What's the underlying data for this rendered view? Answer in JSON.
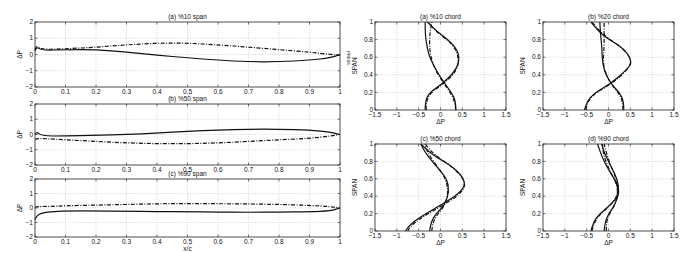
{
  "figure": {
    "side_label": "PRESS"
  },
  "chart_data": [
    {
      "id": "a_span",
      "type": "line",
      "title": "(a) %10 span",
      "xlabel": "",
      "ylabel": "ΔP",
      "xlim": [
        0,
        1
      ],
      "ylim": [
        -2,
        2
      ],
      "xticks": [
        0,
        0.1,
        0.2,
        0.3,
        0.4,
        0.5,
        0.6,
        0.7,
        0.8,
        0.9,
        1
      ],
      "yticks": [
        -2,
        -1,
        0,
        1,
        2
      ],
      "grid": true,
      "series": [
        {
          "name": "solid",
          "style": "solid",
          "x": [
            0,
            0.005,
            0.02,
            0.1,
            0.2,
            0.3,
            0.4,
            0.5,
            0.6,
            0.7,
            0.8,
            0.9,
            0.97,
            1
          ],
          "y": [
            0.2,
            0.5,
            0.25,
            0.3,
            0.3,
            0.15,
            -0.05,
            -0.2,
            -0.35,
            -0.45,
            -0.45,
            -0.35,
            -0.2,
            0
          ]
        },
        {
          "name": "dash-dot",
          "style": "dashed",
          "x": [
            0,
            0.005,
            0.02,
            0.1,
            0.2,
            0.3,
            0.4,
            0.5,
            0.6,
            0.7,
            0.8,
            0.9,
            0.97,
            1
          ],
          "y": [
            0.3,
            0.6,
            0.3,
            0.35,
            0.45,
            0.6,
            0.7,
            0.7,
            0.6,
            0.45,
            0.3,
            0.15,
            0.0,
            -0.05
          ]
        }
      ]
    },
    {
      "id": "b_span",
      "type": "line",
      "title": "(b) %50 span",
      "xlabel": "",
      "ylabel": "ΔP",
      "xlim": [
        0,
        1
      ],
      "ylim": [
        -2,
        2
      ],
      "xticks": [
        0,
        0.1,
        0.2,
        0.3,
        0.4,
        0.5,
        0.6,
        0.7,
        0.8,
        0.9,
        1
      ],
      "yticks": [
        -2,
        -1,
        0,
        1,
        2
      ],
      "grid": true,
      "series": [
        {
          "name": "solid",
          "style": "solid",
          "x": [
            0,
            0.005,
            0.02,
            0.1,
            0.2,
            0.3,
            0.4,
            0.5,
            0.6,
            0.7,
            0.8,
            0.9,
            0.97,
            1
          ],
          "y": [
            0.0,
            0.2,
            -0.1,
            -0.1,
            -0.05,
            0.0,
            0.1,
            0.2,
            0.3,
            0.35,
            0.35,
            0.3,
            0.15,
            0
          ]
        },
        {
          "name": "dash-dot",
          "style": "dashed",
          "x": [
            0,
            0.005,
            0.02,
            0.1,
            0.2,
            0.3,
            0.4,
            0.5,
            0.6,
            0.7,
            0.8,
            0.9,
            0.97,
            1
          ],
          "y": [
            -0.3,
            -0.3,
            -0.25,
            -0.35,
            -0.45,
            -0.55,
            -0.6,
            -0.6,
            -0.55,
            -0.45,
            -0.35,
            -0.25,
            -0.1,
            0
          ]
        }
      ]
    },
    {
      "id": "c_span",
      "type": "line",
      "title": "(c) %90 span",
      "xlabel": "x/c",
      "ylabel": "ΔP",
      "xlim": [
        0,
        1
      ],
      "ylim": [
        -2,
        2
      ],
      "xticks": [
        0,
        0.1,
        0.2,
        0.3,
        0.4,
        0.5,
        0.6,
        0.7,
        0.8,
        0.9,
        1
      ],
      "yticks": [
        -2,
        -1,
        0,
        1,
        2
      ],
      "grid": true,
      "series": [
        {
          "name": "solid",
          "style": "solid",
          "x": [
            0,
            0.005,
            0.02,
            0.05,
            0.1,
            0.2,
            0.3,
            0.4,
            0.5,
            0.6,
            0.7,
            0.8,
            0.9,
            0.97,
            1
          ],
          "y": [
            -0.8,
            -0.55,
            -0.35,
            -0.25,
            -0.2,
            -0.2,
            -0.22,
            -0.25,
            -0.25,
            -0.28,
            -0.3,
            -0.28,
            -0.25,
            -0.2,
            0
          ]
        },
        {
          "name": "dash-dot",
          "style": "dashed",
          "x": [
            0,
            0.005,
            0.02,
            0.05,
            0.1,
            0.2,
            0.3,
            0.4,
            0.5,
            0.6,
            0.7,
            0.8,
            0.9,
            0.97,
            1
          ],
          "y": [
            0.05,
            0.1,
            0.1,
            0.12,
            0.15,
            0.2,
            0.25,
            0.3,
            0.3,
            0.3,
            0.28,
            0.25,
            0.18,
            0.1,
            0
          ]
        }
      ]
    },
    {
      "id": "a_chord",
      "type": "line",
      "title": "(a) %10 chord",
      "xlabel": "ΔP",
      "ylabel": "SPAN",
      "xlim": [
        -1.5,
        1.5
      ],
      "ylim": [
        0,
        1
      ],
      "xticks": [
        -1.5,
        -1,
        -0.5,
        0,
        0.5,
        1,
        1.5
      ],
      "yticks": [
        0,
        0.2,
        0.4,
        0.6,
        0.8,
        1
      ],
      "grid": true,
      "series": [
        {
          "name": "solid-1",
          "style": "solid",
          "x": [
            0.35,
            0.35,
            0.25,
            0.1,
            -0.1,
            -0.25,
            -0.3,
            -0.35,
            -0.35
          ],
          "y": [
            0,
            0.1,
            0.2,
            0.3,
            0.45,
            0.6,
            0.7,
            0.85,
            1.0
          ]
        },
        {
          "name": "solid-2",
          "style": "solid",
          "x": [
            -0.35,
            -0.35,
            -0.25,
            0.05,
            0.35,
            0.45,
            0.3,
            -0.1,
            -0.3
          ],
          "y": [
            0,
            0.1,
            0.2,
            0.3,
            0.45,
            0.6,
            0.75,
            0.9,
            1.0
          ]
        },
        {
          "name": "dashed-1",
          "style": "dashed",
          "x": [
            0.35,
            0.33,
            0.22,
            0.08,
            -0.12,
            -0.22,
            -0.25,
            -0.25,
            -0.2
          ],
          "y": [
            0,
            0.1,
            0.2,
            0.3,
            0.45,
            0.6,
            0.7,
            0.85,
            1.0
          ]
        },
        {
          "name": "dashed-2",
          "style": "dashed",
          "x": [
            -0.33,
            -0.33,
            -0.22,
            0.08,
            0.38,
            0.42,
            0.28,
            -0.12,
            -0.28
          ],
          "y": [
            0,
            0.1,
            0.2,
            0.3,
            0.45,
            0.6,
            0.75,
            0.9,
            1.0
          ]
        }
      ]
    },
    {
      "id": "b_chord",
      "type": "line",
      "title": "(b) %20 chord",
      "xlabel": "ΔP",
      "ylabel": "SPAN",
      "xlim": [
        -1.5,
        1.5
      ],
      "ylim": [
        0,
        1
      ],
      "xticks": [
        -1.5,
        -1,
        -0.5,
        0,
        0.5,
        1,
        1.5
      ],
      "yticks": [
        0,
        0.2,
        0.4,
        0.6,
        0.8,
        1
      ],
      "grid": true,
      "series": [
        {
          "name": "solid-1",
          "style": "solid",
          "x": [
            0.35,
            0.35,
            0.25,
            0.05,
            -0.1,
            -0.15,
            -0.15,
            -0.18,
            -0.2
          ],
          "y": [
            0,
            0.1,
            0.2,
            0.3,
            0.45,
            0.6,
            0.7,
            0.85,
            1.0
          ]
        },
        {
          "name": "solid-2",
          "style": "solid",
          "x": [
            -0.55,
            -0.5,
            -0.3,
            0.05,
            0.4,
            0.55,
            0.35,
            -0.15,
            -0.4
          ],
          "y": [
            0,
            0.1,
            0.2,
            0.3,
            0.45,
            0.55,
            0.7,
            0.85,
            1.0
          ]
        },
        {
          "name": "dashed-1",
          "style": "dashed",
          "x": [
            0.33,
            0.33,
            0.22,
            0.05,
            -0.1,
            -0.12,
            -0.1,
            -0.1,
            -0.1
          ],
          "y": [
            0,
            0.1,
            0.2,
            0.3,
            0.45,
            0.6,
            0.7,
            0.85,
            1.0
          ]
        },
        {
          "name": "dashed-2",
          "style": "dashed",
          "x": [
            -0.52,
            -0.48,
            -0.28,
            0.08,
            0.42,
            0.55,
            0.35,
            -0.12,
            -0.38
          ],
          "y": [
            0,
            0.1,
            0.2,
            0.3,
            0.45,
            0.55,
            0.7,
            0.85,
            1.0
          ]
        }
      ]
    },
    {
      "id": "c_chord",
      "type": "line",
      "title": "(c) %50 chord",
      "xlabel": "ΔP",
      "ylabel": "SPAN",
      "xlim": [
        -1.5,
        1.5
      ],
      "ylim": [
        0,
        1
      ],
      "xticks": [
        -1.5,
        -1,
        -0.5,
        0,
        0.5,
        1,
        1.5
      ],
      "yticks": [
        0,
        0.2,
        0.4,
        0.6,
        0.8,
        1
      ],
      "grid": true,
      "series": [
        {
          "name": "solid-1",
          "style": "solid",
          "x": [
            -0.8,
            -0.75,
            -0.5,
            -0.05,
            0.4,
            0.6,
            0.35,
            -0.2,
            -0.45
          ],
          "y": [
            0,
            0.05,
            0.15,
            0.28,
            0.42,
            0.55,
            0.72,
            0.88,
            1.0
          ]
        },
        {
          "name": "solid-2",
          "style": "solid",
          "x": [
            -0.25,
            -0.22,
            -0.1,
            0.1,
            0.2,
            0.15,
            -0.1,
            -0.35,
            -0.45
          ],
          "y": [
            0,
            0.1,
            0.2,
            0.3,
            0.45,
            0.6,
            0.75,
            0.9,
            1.0
          ]
        },
        {
          "name": "dashed-1",
          "style": "dashed",
          "x": [
            -0.75,
            -0.7,
            -0.45,
            0.0,
            0.45,
            0.6,
            0.32,
            -0.15,
            -0.35
          ],
          "y": [
            0,
            0.05,
            0.15,
            0.28,
            0.42,
            0.55,
            0.72,
            0.88,
            1.0
          ]
        },
        {
          "name": "dashed-2",
          "style": "dashed",
          "x": [
            -0.2,
            -0.18,
            -0.05,
            0.1,
            0.18,
            0.12,
            -0.08,
            -0.3,
            -0.35
          ],
          "y": [
            0,
            0.1,
            0.2,
            0.3,
            0.45,
            0.6,
            0.75,
            0.9,
            1.0
          ]
        }
      ]
    },
    {
      "id": "d_chord",
      "type": "line",
      "title": "(d) %90 chord",
      "xlabel": "ΔP",
      "ylabel": "SPAN",
      "xlim": [
        -1.5,
        1.5
      ],
      "ylim": [
        0,
        1
      ],
      "xticks": [
        -1.5,
        -1,
        -0.5,
        0,
        0.5,
        1,
        1.5
      ],
      "yticks": [
        0,
        0.2,
        0.4,
        0.6,
        0.8,
        1
      ],
      "grid": true,
      "series": [
        {
          "name": "solid-1",
          "style": "solid",
          "x": [
            -0.4,
            -0.35,
            -0.2,
            0.05,
            0.25,
            0.2,
            0.0,
            -0.15,
            -0.25
          ],
          "y": [
            0,
            0.1,
            0.2,
            0.3,
            0.42,
            0.55,
            0.7,
            0.85,
            1.0
          ]
        },
        {
          "name": "solid-2",
          "style": "solid",
          "x": [
            -0.1,
            -0.08,
            0.0,
            0.15,
            0.25,
            0.2,
            0.05,
            -0.1,
            -0.15
          ],
          "y": [
            0,
            0.1,
            0.2,
            0.3,
            0.45,
            0.6,
            0.75,
            0.9,
            1.0
          ]
        },
        {
          "name": "dashed-1",
          "style": "dashed",
          "x": [
            -0.38,
            -0.33,
            -0.18,
            0.06,
            0.22,
            0.18,
            0.02,
            -0.1,
            -0.15
          ],
          "y": [
            0,
            0.1,
            0.2,
            0.3,
            0.42,
            0.55,
            0.7,
            0.85,
            1.0
          ]
        },
        {
          "name": "dashed-2",
          "style": "dashed",
          "x": [
            -0.05,
            -0.05,
            0.02,
            0.15,
            0.22,
            0.18,
            0.05,
            -0.05,
            -0.1
          ],
          "y": [
            0,
            0.1,
            0.2,
            0.3,
            0.45,
            0.6,
            0.75,
            0.9,
            1.0
          ]
        }
      ]
    }
  ],
  "layout": {
    "panels": [
      {
        "id": "a_span",
        "x": 35,
        "y": 22,
        "w": 305,
        "h": 65
      },
      {
        "id": "b_span",
        "x": 35,
        "y": 104,
        "w": 305,
        "h": 61
      },
      {
        "id": "c_span",
        "x": 35,
        "y": 179,
        "w": 305,
        "h": 58
      },
      {
        "id": "a_chord",
        "x": 375,
        "y": 22,
        "w": 131,
        "h": 88
      },
      {
        "id": "b_chord",
        "x": 543,
        "y": 22,
        "w": 131,
        "h": 88
      },
      {
        "id": "c_chord",
        "x": 375,
        "y": 144,
        "w": 131,
        "h": 87
      },
      {
        "id": "d_chord",
        "x": 543,
        "y": 144,
        "w": 131,
        "h": 87
      }
    ]
  }
}
